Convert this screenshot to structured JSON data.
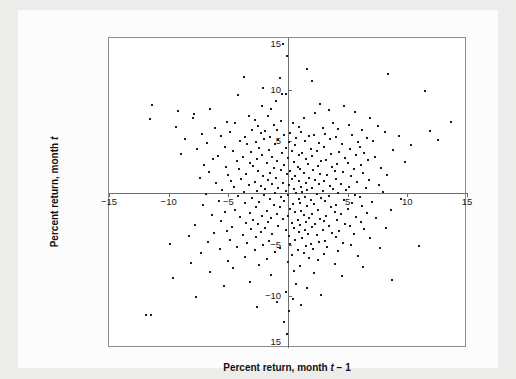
{
  "figure": {
    "background_color": "#ececeb",
    "card_color": "#fcfcfc",
    "plot_background": "#ffffff",
    "frame_color": "#8c8c8c",
    "axis_color": "#6d6d6d",
    "point_color": "#1b1b1b"
  },
  "axis_titles": {
    "x_prefix": "Percent return, month ",
    "x_italic": "t",
    "x_suffix": " − 1",
    "y_prefix": "Percent return, month ",
    "y_italic": "t",
    "y_suffix": ""
  },
  "chart_data": {
    "type": "scatter",
    "title": "",
    "xlabel": "Percent return, month t − 1",
    "ylabel": "Percent return, month t",
    "xlim": [
      -15,
      15
    ],
    "ylim": [
      -15,
      15
    ],
    "grid": false,
    "legend": null,
    "axes_style": "centered-zero-crosshair-with-outer-box",
    "marker": "small-filled-dot",
    "xticks": [
      -15,
      -10,
      -5,
      5,
      10,
      15
    ],
    "xticklabels": [
      "−15",
      "−10",
      "−5",
      "5",
      "10",
      "15"
    ],
    "yticks": [
      15,
      10,
      5,
      -5,
      -10,
      -15
    ],
    "yticklabels": [
      "15",
      "10",
      "5",
      "−5",
      "−10",
      "15"
    ],
    "n_points": 372,
    "points": [
      [
        -0.4,
        14.4
      ],
      [
        -0.1,
        13.3
      ],
      [
        1.6,
        12.0
      ],
      [
        8.4,
        11.5
      ],
      [
        -3.7,
        11.2
      ],
      [
        -0.7,
        11.1
      ],
      [
        2.0,
        10.8
      ],
      [
        -2.1,
        10.2
      ],
      [
        11.5,
        9.9
      ],
      [
        -0.5,
        9.6
      ],
      [
        -0.2,
        9.6
      ],
      [
        -4.2,
        9.5
      ],
      [
        -1.0,
        8.9
      ],
      [
        -11.4,
        8.5
      ],
      [
        -2.2,
        8.4
      ],
      [
        2.7,
        8.6
      ],
      [
        -1.4,
        8.1
      ],
      [
        4.7,
        8.4
      ],
      [
        -6.5,
        8.1
      ],
      [
        -9.2,
        7.9
      ],
      [
        3.4,
        8.0
      ],
      [
        2.3,
        7.7
      ],
      [
        5.6,
        7.8
      ],
      [
        -7.9,
        7.6
      ],
      [
        -3.3,
        7.5
      ],
      [
        -1.7,
        7.5
      ],
      [
        -8.0,
        7.3
      ],
      [
        -11.6,
        7.2
      ],
      [
        1.3,
        7.3
      ],
      [
        6.9,
        7.3
      ],
      [
        -2.8,
        7.1
      ],
      [
        -0.6,
        7.0
      ],
      [
        -5.1,
        6.9
      ],
      [
        -4.4,
        6.8
      ],
      [
        13.7,
        6.9
      ],
      [
        0.4,
        6.8
      ],
      [
        3.8,
        6.8
      ],
      [
        -1.2,
        6.6
      ],
      [
        5.1,
        6.6
      ],
      [
        -2.5,
        6.5
      ],
      [
        7.5,
        6.5
      ],
      [
        -9.4,
        6.4
      ],
      [
        0.9,
        6.4
      ],
      [
        -6.1,
        6.3
      ],
      [
        2.9,
        6.3
      ],
      [
        4.2,
        6.2
      ],
      [
        -3.0,
        6.1
      ],
      [
        -0.9,
        6.1
      ],
      [
        6.2,
        6.1
      ],
      [
        11.9,
        6.0
      ],
      [
        -1.9,
        6.0
      ],
      [
        1.1,
        5.9
      ],
      [
        -4.9,
        5.9
      ],
      [
        8.1,
        5.9
      ],
      [
        -2.3,
        5.8
      ],
      [
        0.2,
        5.8
      ],
      [
        3.1,
        5.7
      ],
      [
        -7.2,
        5.7
      ],
      [
        5.4,
        5.6
      ],
      [
        -0.3,
        5.6
      ],
      [
        2.2,
        5.6
      ],
      [
        -5.6,
        5.5
      ],
      [
        1.8,
        5.5
      ],
      [
        9.3,
        5.5
      ],
      [
        -1.5,
        5.4
      ],
      [
        -3.6,
        5.4
      ],
      [
        4.0,
        5.4
      ],
      [
        6.6,
        5.3
      ],
      [
        0.7,
        5.3
      ],
      [
        -2.0,
        5.2
      ],
      [
        -8.6,
        5.2
      ],
      [
        3.5,
        5.2
      ],
      [
        12.6,
        5.1
      ],
      [
        -0.8,
        5.1
      ],
      [
        1.4,
        5.0
      ],
      [
        -4.0,
        5.0
      ],
      [
        7.1,
        5.0
      ],
      [
        -2.7,
        4.9
      ],
      [
        5.9,
        4.9
      ],
      [
        0.1,
        4.9
      ],
      [
        -6.8,
        4.8
      ],
      [
        2.6,
        4.8
      ],
      [
        -1.1,
        4.7
      ],
      [
        4.5,
        4.7
      ],
      [
        -3.4,
        4.7
      ],
      [
        10.3,
        4.6
      ],
      [
        0.6,
        4.6
      ],
      [
        -5.3,
        4.5
      ],
      [
        3.0,
        4.5
      ],
      [
        6.0,
        4.5
      ],
      [
        -0.2,
        4.4
      ],
      [
        -2.4,
        4.4
      ],
      [
        1.9,
        4.3
      ],
      [
        -7.6,
        4.3
      ],
      [
        5.2,
        4.3
      ],
      [
        -1.6,
        4.2
      ],
      [
        8.8,
        4.2
      ],
      [
        2.4,
        4.1
      ],
      [
        -4.6,
        4.1
      ],
      [
        0.3,
        4.1
      ],
      [
        -3.1,
        4.0
      ],
      [
        4.3,
        4.0
      ],
      [
        6.4,
        3.9
      ],
      [
        -0.5,
        3.9
      ],
      [
        1.2,
        3.9
      ],
      [
        -9.0,
        3.8
      ],
      [
        3.6,
        3.8
      ],
      [
        -2.2,
        3.7
      ],
      [
        5.7,
        3.7
      ],
      [
        0.9,
        3.7
      ],
      [
        -5.9,
        3.6
      ],
      [
        2.0,
        3.6
      ],
      [
        -1.3,
        3.5
      ],
      [
        7.3,
        3.5
      ],
      [
        -3.8,
        3.5
      ],
      [
        4.8,
        3.4
      ],
      [
        0.0,
        3.4
      ],
      [
        -2.6,
        3.3
      ],
      [
        1.5,
        3.3
      ],
      [
        -6.3,
        3.3
      ],
      [
        3.2,
        3.2
      ],
      [
        6.7,
        3.2
      ],
      [
        -0.9,
        3.1
      ],
      [
        -4.3,
        3.1
      ],
      [
        2.8,
        3.1
      ],
      [
        9.8,
        3.0
      ],
      [
        0.5,
        3.0
      ],
      [
        -1.8,
        2.9
      ],
      [
        5.0,
        2.9
      ],
      [
        -3.2,
        2.9
      ],
      [
        1.7,
        2.8
      ],
      [
        4.1,
        2.8
      ],
      [
        -7.0,
        2.7
      ],
      [
        -0.3,
        2.7
      ],
      [
        6.1,
        2.7
      ],
      [
        2.5,
        2.6
      ],
      [
        -2.9,
        2.6
      ],
      [
        0.8,
        2.5
      ],
      [
        -5.2,
        2.5
      ],
      [
        3.7,
        2.5
      ],
      [
        -1.2,
        2.4
      ],
      [
        7.8,
        2.4
      ],
      [
        1.0,
        2.3
      ],
      [
        -4.1,
        2.3
      ],
      [
        5.5,
        2.3
      ],
      [
        -0.6,
        2.2
      ],
      [
        2.1,
        2.2
      ],
      [
        -2.5,
        2.1
      ],
      [
        3.9,
        2.1
      ],
      [
        0.2,
        2.1
      ],
      [
        -6.6,
        2.0
      ],
      [
        4.6,
        2.0
      ],
      [
        -1.5,
        1.9
      ],
      [
        1.3,
        1.9
      ],
      [
        6.3,
        1.9
      ],
      [
        -3.5,
        1.8
      ],
      [
        2.7,
        1.8
      ],
      [
        -0.1,
        1.8
      ],
      [
        8.3,
        1.7
      ],
      [
        -5.0,
        1.7
      ],
      [
        3.3,
        1.7
      ],
      [
        0.6,
        1.6
      ],
      [
        -2.1,
        1.6
      ],
      [
        5.3,
        1.6
      ],
      [
        -1.0,
        1.5
      ],
      [
        1.8,
        1.5
      ],
      [
        -7.4,
        1.5
      ],
      [
        4.0,
        1.4
      ],
      [
        -3.9,
        1.4
      ],
      [
        0.3,
        1.4
      ],
      [
        2.3,
        1.3
      ],
      [
        6.8,
        1.3
      ],
      [
        -1.7,
        1.3
      ],
      [
        -4.8,
        1.2
      ],
      [
        3.0,
        1.2
      ],
      [
        0.9,
        1.2
      ],
      [
        -2.8,
        1.1
      ],
      [
        5.8,
        1.1
      ],
      [
        1.5,
        1.0
      ],
      [
        -0.4,
        1.0
      ],
      [
        -6.0,
        1.0
      ],
      [
        4.4,
        0.9
      ],
      [
        -1.3,
        0.9
      ],
      [
        2.6,
        0.9
      ],
      [
        7.6,
        0.8
      ],
      [
        -3.3,
        0.8
      ],
      [
        0.1,
        0.8
      ],
      [
        3.5,
        0.7
      ],
      [
        -2.3,
        0.7
      ],
      [
        1.1,
        0.6
      ],
      [
        5.1,
        0.6
      ],
      [
        -4.5,
        0.6
      ],
      [
        -0.8,
        0.5
      ],
      [
        2.0,
        0.5
      ],
      [
        6.5,
        0.5
      ],
      [
        -1.9,
        0.4
      ],
      [
        3.8,
        0.4
      ],
      [
        0.5,
        0.4
      ],
      [
        -5.5,
        0.3
      ],
      [
        4.9,
        0.3
      ],
      [
        1.6,
        0.3
      ],
      [
        -2.6,
        0.2
      ],
      [
        -0.2,
        0.2
      ],
      [
        2.9,
        0.2
      ],
      [
        8.0,
        0.1
      ],
      [
        -3.7,
        0.1
      ],
      [
        1.2,
        0.1
      ],
      [
        -1.1,
        0.0
      ],
      [
        4.2,
        0.0
      ],
      [
        0.7,
        0.0
      ],
      [
        -6.9,
        -0.1
      ],
      [
        2.4,
        -0.1
      ],
      [
        5.6,
        -0.2
      ],
      [
        -2.0,
        -0.2
      ],
      [
        0.0,
        -0.2
      ],
      [
        3.4,
        -0.3
      ],
      [
        -4.2,
        -0.3
      ],
      [
        1.4,
        -0.4
      ],
      [
        -0.6,
        -0.4
      ],
      [
        6.0,
        -0.4
      ],
      [
        2.8,
        -0.5
      ],
      [
        -3.0,
        -0.5
      ],
      [
        9.5,
        -0.6
      ],
      [
        0.9,
        -0.6
      ],
      [
        -1.5,
        -0.6
      ],
      [
        4.7,
        -0.7
      ],
      [
        1.9,
        -0.7
      ],
      [
        -5.8,
        -0.8
      ],
      [
        -0.3,
        -0.8
      ],
      [
        3.1,
        -0.8
      ],
      [
        7.0,
        -0.9
      ],
      [
        -2.4,
        -0.9
      ],
      [
        1.0,
        -1.0
      ],
      [
        5.4,
        -1.0
      ],
      [
        -3.6,
        -1.0
      ],
      [
        0.4,
        -1.1
      ],
      [
        2.2,
        -1.1
      ],
      [
        -1.2,
        -1.2
      ],
      [
        4.0,
        -1.2
      ],
      [
        -7.1,
        -1.2
      ],
      [
        6.2,
        -1.3
      ],
      [
        1.6,
        -1.3
      ],
      [
        -0.7,
        -1.4
      ],
      [
        3.6,
        -1.4
      ],
      [
        -2.7,
        -1.4
      ],
      [
        0.2,
        -1.5
      ],
      [
        5.0,
        -1.5
      ],
      [
        -4.4,
        -1.6
      ],
      [
        2.5,
        -1.6
      ],
      [
        8.6,
        -1.6
      ],
      [
        -1.8,
        -1.7
      ],
      [
        1.1,
        -1.7
      ],
      [
        3.9,
        -1.8
      ],
      [
        -5.3,
        -1.8
      ],
      [
        0.6,
        -1.8
      ],
      [
        6.6,
        -1.9
      ],
      [
        -3.2,
        -1.9
      ],
      [
        2.0,
        -2.0
      ],
      [
        -0.9,
        -2.0
      ],
      [
        4.4,
        -2.0
      ],
      [
        1.3,
        -2.1
      ],
      [
        -6.4,
        -2.1
      ],
      [
        3.2,
        -2.2
      ],
      [
        -2.2,
        -2.2
      ],
      [
        0.0,
        -2.2
      ],
      [
        5.7,
        -2.3
      ],
      [
        -4.0,
        -2.3
      ],
      [
        1.8,
        -2.4
      ],
      [
        -1.4,
        -2.4
      ],
      [
        7.4,
        -2.4
      ],
      [
        2.7,
        -2.5
      ],
      [
        -0.4,
        -2.5
      ],
      [
        4.1,
        -2.6
      ],
      [
        -2.9,
        -2.6
      ],
      [
        0.8,
        -2.6
      ],
      [
        -5.6,
        -2.7
      ],
      [
        3.0,
        -2.7
      ],
      [
        6.1,
        -2.8
      ],
      [
        -1.7,
        -2.8
      ],
      [
        1.5,
        -2.8
      ],
      [
        -3.5,
        -2.9
      ],
      [
        0.3,
        -2.9
      ],
      [
        4.8,
        -3.0
      ],
      [
        2.3,
        -3.0
      ],
      [
        -2.5,
        -3.0
      ],
      [
        -7.8,
        -3.1
      ],
      [
        1.0,
        -3.1
      ],
      [
        5.2,
        -3.2
      ],
      [
        -0.8,
        -3.2
      ],
      [
        3.4,
        -3.2
      ],
      [
        -4.7,
        -3.3
      ],
      [
        2.0,
        -3.3
      ],
      [
        8.2,
        -3.4
      ],
      [
        -1.9,
        -3.4
      ],
      [
        0.5,
        -3.4
      ],
      [
        6.4,
        -3.5
      ],
      [
        -3.1,
        -3.5
      ],
      [
        2.9,
        -3.6
      ],
      [
        -0.2,
        -3.6
      ],
      [
        1.4,
        -3.6
      ],
      [
        -5.1,
        -3.7
      ],
      [
        4.3,
        -3.7
      ],
      [
        -2.3,
        -3.8
      ],
      [
        0.9,
        -3.8
      ],
      [
        3.7,
        -3.9
      ],
      [
        -6.2,
        -3.9
      ],
      [
        1.7,
        -4.0
      ],
      [
        5.5,
        -4.0
      ],
      [
        -1.3,
        -4.0
      ],
      [
        -3.8,
        -4.1
      ],
      [
        2.4,
        -4.1
      ],
      [
        0.1,
        -4.2
      ],
      [
        -8.3,
        -4.2
      ],
      [
        4.0,
        -4.3
      ],
      [
        -2.7,
        -4.3
      ],
      [
        1.2,
        -4.4
      ],
      [
        6.9,
        -4.4
      ],
      [
        -4.9,
        -4.5
      ],
      [
        0.6,
        -4.5
      ],
      [
        3.1,
        -4.6
      ],
      [
        -1.6,
        -4.6
      ],
      [
        2.6,
        -4.7
      ],
      [
        -6.7,
        -4.7
      ],
      [
        4.6,
        -4.8
      ],
      [
        -3.4,
        -4.8
      ],
      [
        1.9,
        -4.9
      ],
      [
        0.2,
        -4.9
      ],
      [
        -9.9,
        -4.9
      ],
      [
        5.3,
        -5.0
      ],
      [
        -2.1,
        -5.0
      ],
      [
        11.0,
        -5.1
      ],
      [
        1.5,
        -5.1
      ],
      [
        -4.3,
        -5.2
      ],
      [
        3.3,
        -5.2
      ],
      [
        -0.7,
        -5.3
      ],
      [
        7.7,
        -5.3
      ],
      [
        2.1,
        -5.4
      ],
      [
        -5.7,
        -5.4
      ],
      [
        0.8,
        -5.5
      ],
      [
        -2.8,
        -5.5
      ],
      [
        4.2,
        -5.6
      ],
      [
        -1.1,
        -5.7
      ],
      [
        1.3,
        -5.8
      ],
      [
        -7.3,
        -5.8
      ],
      [
        3.0,
        -5.9
      ],
      [
        0.3,
        -6.0
      ],
      [
        5.9,
        -6.1
      ],
      [
        -3.6,
        -6.2
      ],
      [
        1.8,
        -6.3
      ],
      [
        -1.8,
        -6.4
      ],
      [
        2.5,
        -6.5
      ],
      [
        -5.0,
        -6.6
      ],
      [
        0.0,
        -6.7
      ],
      [
        -8.1,
        -6.8
      ],
      [
        3.9,
        -6.9
      ],
      [
        -2.4,
        -7.0
      ],
      [
        1.0,
        -7.1
      ],
      [
        6.3,
        -7.2
      ],
      [
        -4.6,
        -7.3
      ],
      [
        0.5,
        -7.5
      ],
      [
        -6.5,
        -7.6
      ],
      [
        2.2,
        -7.7
      ],
      [
        -1.4,
        -7.9
      ],
      [
        4.5,
        -8.0
      ],
      [
        -9.6,
        -8.2
      ],
      [
        8.7,
        -8.4
      ],
      [
        -3.2,
        -8.6
      ],
      [
        0.7,
        -8.8
      ],
      [
        -5.4,
        -9.0
      ],
      [
        1.6,
        -9.2
      ],
      [
        -0.2,
        -9.6
      ],
      [
        2.8,
        -9.9
      ],
      [
        -7.7,
        -10.1
      ],
      [
        0.4,
        -10.3
      ],
      [
        -0.9,
        -10.5
      ],
      [
        1.1,
        -10.8
      ],
      [
        -2.6,
        -11.0
      ],
      [
        0.1,
        -11.4
      ],
      [
        -11.9,
        -11.8
      ],
      [
        -11.5,
        -11.8
      ],
      [
        -0.3,
        -12.5
      ],
      [
        -0.1,
        -13.6
      ]
    ]
  }
}
